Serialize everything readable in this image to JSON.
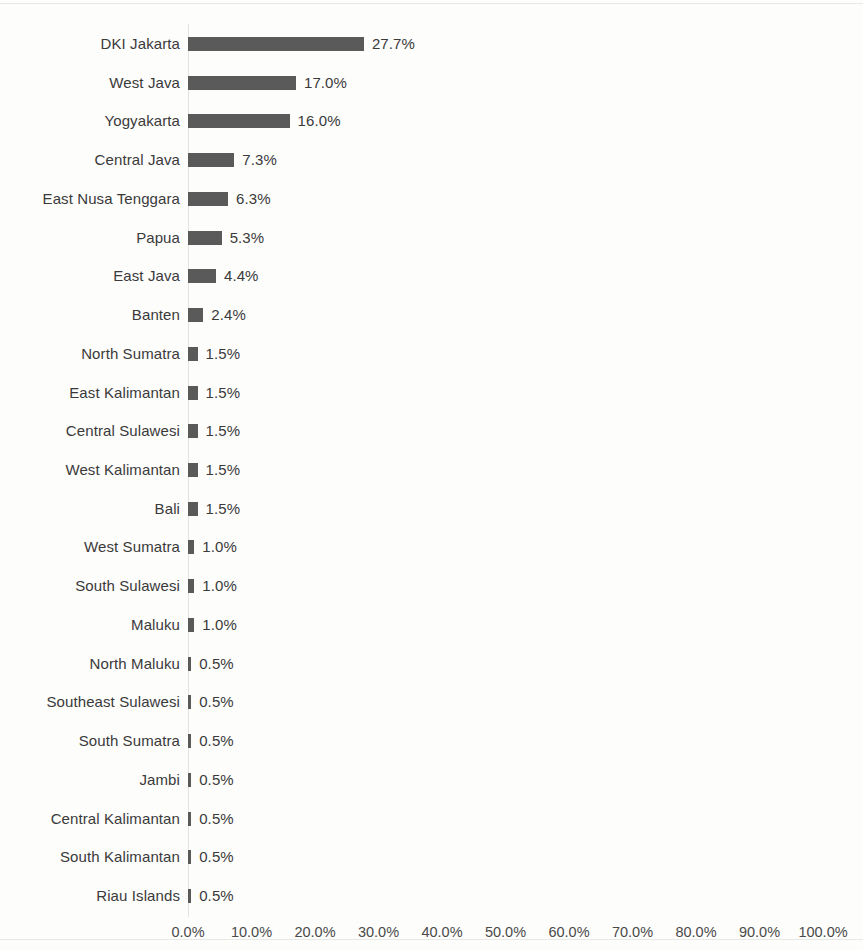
{
  "chart_data": {
    "type": "bar",
    "orientation": "horizontal",
    "title": "",
    "subtitle": "",
    "xlabel": "",
    "ylabel": "",
    "xlim": [
      0,
      100
    ],
    "grid": false,
    "legend": false,
    "value_suffix": "%",
    "axis_ticks": [
      "0.0%",
      "10.0%",
      "20.0%",
      "30.0%",
      "40.0%",
      "50.0%",
      "60.0%",
      "70.0%",
      "80.0%",
      "90.0%",
      "100.0%"
    ],
    "tick_values": [
      0,
      10,
      20,
      30,
      40,
      50,
      60,
      70,
      80,
      90,
      100
    ],
    "categories": [
      "DKI Jakarta",
      "West Java",
      "Yogyakarta",
      "Central Java",
      "East Nusa Tenggara",
      "Papua",
      "East Java",
      "Banten",
      "North Sumatra",
      "East Kalimantan",
      "Central Sulawesi",
      "West Kalimantan",
      "Bali",
      "West Sumatra",
      "South Sulawesi",
      "Maluku",
      "North Maluku",
      "Southeast Sulawesi",
      "South Sumatra",
      "Jambi",
      "Central Kalimantan",
      "South Kalimantan",
      "Riau Islands"
    ],
    "values": [
      27.7,
      17.0,
      16.0,
      7.3,
      6.3,
      5.3,
      4.4,
      2.4,
      1.5,
      1.5,
      1.5,
      1.5,
      1.5,
      1.0,
      1.0,
      1.0,
      0.5,
      0.5,
      0.5,
      0.5,
      0.5,
      0.5,
      0.5
    ],
    "data_labels": [
      "27.7%",
      "17.0%",
      "16.0%",
      "7.3%",
      "6.3%",
      "5.3%",
      "4.4%",
      "2.4%",
      "1.5%",
      "1.5%",
      "1.5%",
      "1.5%",
      "1.5%",
      "1.0%",
      "1.0%",
      "1.0%",
      "0.5%",
      "0.5%",
      "0.5%",
      "0.5%",
      "0.5%",
      "0.5%",
      "0.5%"
    ],
    "colors": {
      "bar": "#5a5a5a",
      "text": "#3a3a3a",
      "axis_line": "#e3e3e1",
      "background": "#fdfdfc"
    }
  },
  "layout": {
    "axis_origin_x": 188,
    "px_per_percent": 6.35,
    "first_row_y": 44,
    "row_pitch": 38.73,
    "bar_height": 14,
    "min_bar_width": 3,
    "value_gap": 8
  }
}
